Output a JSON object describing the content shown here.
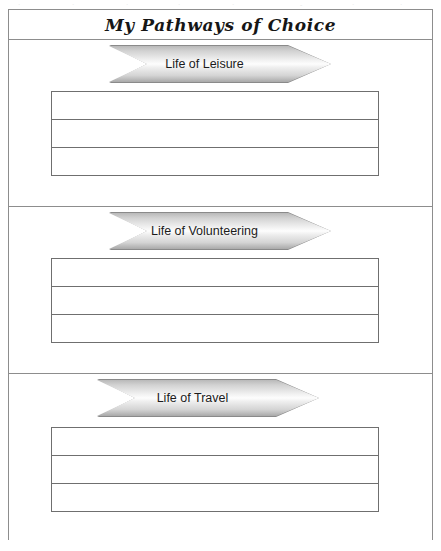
{
  "document": {
    "title": "My Pathways of Choice",
    "type": "worksheet",
    "background_color": "#ffffff",
    "border_color": "#8d8d8d"
  },
  "scan_artifacts": {
    "visible": true,
    "fragments": [
      "·",
      "·",
      "·",
      "·",
      "·",
      "-",
      "·",
      "·"
    ]
  },
  "sections": [
    {
      "id": "section-leisure",
      "arrow_label": "Life of Leisure",
      "rows": [
        "",
        "",
        ""
      ],
      "row_count": 3
    },
    {
      "id": "section-volunteering",
      "arrow_label": "Life of Volunteering",
      "rows": [
        "",
        "",
        ""
      ],
      "row_count": 3
    },
    {
      "id": "section-travel",
      "arrow_label": "Life of Travel",
      "rows": [
        "",
        "",
        ""
      ],
      "row_count": 3
    }
  ],
  "style": {
    "arrow_fill_light": "#fdfdfd",
    "arrow_fill_dark": "#a9a9a9",
    "arrow_stroke": "#8a8a8a",
    "table_line_color": "#6f6f6f",
    "title_color": "#161616"
  }
}
